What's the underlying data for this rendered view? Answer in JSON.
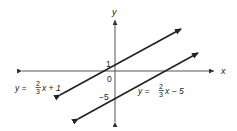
{
  "diagram": {
    "axes": {
      "x_label": "x",
      "y_label": "y",
      "origin_label": "0",
      "tick_labels": {
        "y_1": "1",
        "y_minus5": "−5"
      }
    },
    "lines": [
      {
        "name": "line-upper",
        "equation_lhs": "y =",
        "slope_num": "2",
        "slope_den": "3",
        "equation_rhs": "x + 1",
        "slope": 0.6667,
        "intercept": 1
      },
      {
        "name": "line-lower",
        "equation_lhs": "y =",
        "slope_num": "2",
        "slope_den": "3",
        "equation_rhs": "x − 5",
        "slope": 0.6667,
        "intercept": -5
      }
    ],
    "colors": {
      "stroke": "#222222",
      "axis": "#333333",
      "background": "#ffffff"
    }
  }
}
